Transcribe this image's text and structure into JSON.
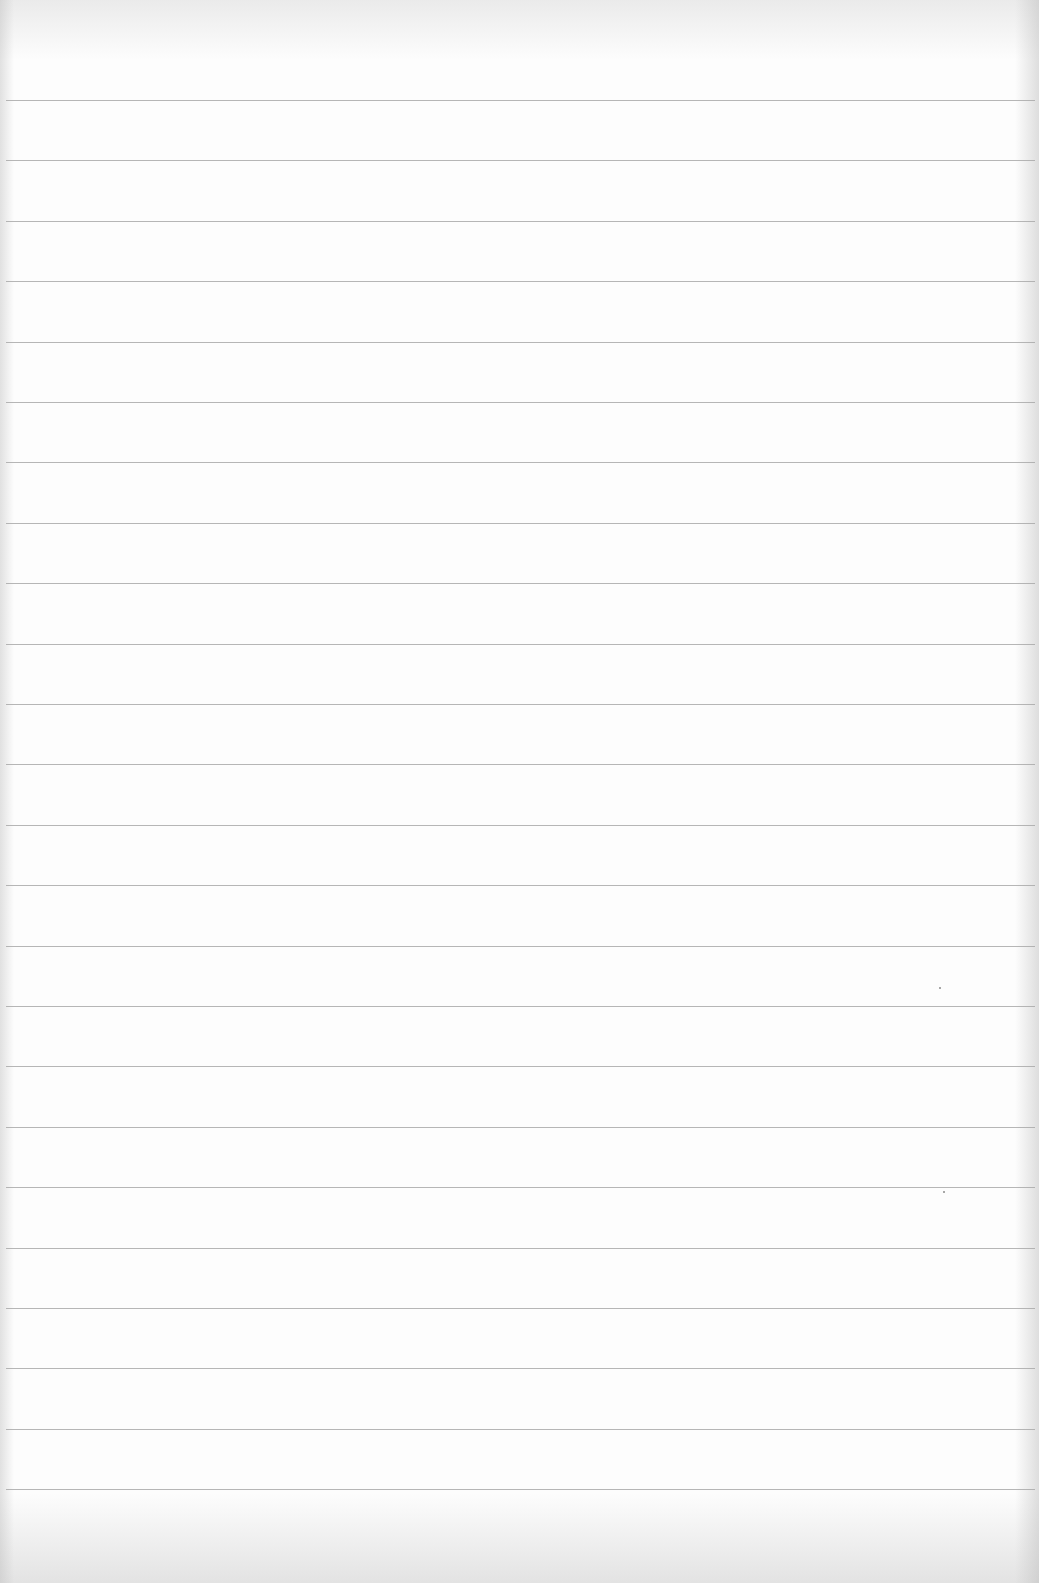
{
  "document": {
    "type": "lined-paper",
    "content_text": "",
    "rule_count": 24,
    "rule_first_y": 100,
    "rule_spacing": 60.4,
    "rule_color": "#a9a9a9",
    "paper_color": "#fdfdfd"
  }
}
